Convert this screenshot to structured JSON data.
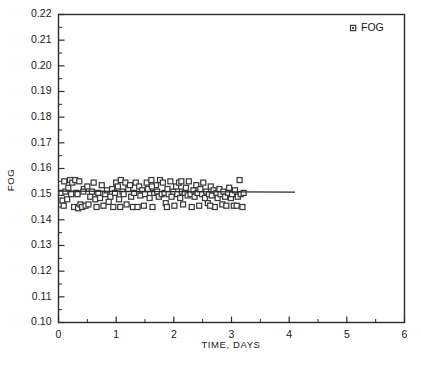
{
  "chart_data": {
    "type": "scatter",
    "title": "",
    "xlabel": "TIME, DAYS",
    "ylabel": "FOG",
    "xlim": [
      0,
      6
    ],
    "ylim": [
      0.1,
      0.22
    ],
    "xticks": [
      0,
      1,
      2,
      3,
      4,
      5,
      6
    ],
    "xtick_labels": [
      "0",
      "1",
      "2",
      "3",
      "4",
      "5",
      "6"
    ],
    "yticks": [
      0.1,
      0.11,
      0.12,
      0.13,
      0.14,
      0.15,
      0.16,
      0.17,
      0.18,
      0.19,
      0.2,
      0.21,
      0.22
    ],
    "ytick_labels": [
      "0.10",
      "0.11",
      "0.12",
      "0.13",
      "0.14",
      "0.15",
      "0.16",
      "0.17",
      "0.18",
      "0.19",
      "0.20",
      "0.21",
      "0.22"
    ],
    "x_minor_tick_step": 0.5,
    "y_minor_tick_step": 0.005,
    "grid": false,
    "legend_position": "top-right",
    "marker_style": "open-square",
    "series": [
      {
        "name": "FOG",
        "marker": "square",
        "points": [
          [
            0.05,
            0.1505
          ],
          [
            0.07,
            0.1475
          ],
          [
            0.1,
            0.155
          ],
          [
            0.12,
            0.151
          ],
          [
            0.15,
            0.148
          ],
          [
            0.17,
            0.1525
          ],
          [
            0.2,
            0.1555
          ],
          [
            0.22,
            0.15
          ],
          [
            0.24,
            0.1545
          ],
          [
            0.27,
            0.145
          ],
          [
            0.29,
            0.1555
          ],
          [
            0.31,
            0.1505
          ],
          [
            0.34,
            0.1445
          ],
          [
            0.36,
            0.155
          ],
          [
            0.38,
            0.146
          ],
          [
            0.41,
            0.145
          ],
          [
            0.44,
            0.152
          ],
          [
            0.47,
            0.1455
          ],
          [
            0.5,
            0.153
          ],
          [
            0.52,
            0.146
          ],
          [
            0.55,
            0.149
          ],
          [
            0.58,
            0.151
          ],
          [
            0.61,
            0.1545
          ],
          [
            0.64,
            0.148
          ],
          [
            0.66,
            0.145
          ],
          [
            0.69,
            0.1505
          ],
          [
            0.72,
            0.1485
          ],
          [
            0.75,
            0.1535
          ],
          [
            0.78,
            0.1455
          ],
          [
            0.81,
            0.15
          ],
          [
            0.84,
            0.1515
          ],
          [
            0.87,
            0.147
          ],
          [
            0.9,
            0.149
          ],
          [
            0.93,
            0.152
          ],
          [
            0.95,
            0.145
          ],
          [
            0.98,
            0.1505
          ],
          [
            1.0,
            0.1545
          ],
          [
            1.03,
            0.153
          ],
          [
            1.05,
            0.148
          ],
          [
            1.08,
            0.1555
          ],
          [
            1.11,
            0.151
          ],
          [
            1.13,
            0.15
          ],
          [
            1.16,
            0.1545
          ],
          [
            1.18,
            0.146
          ],
          [
            1.21,
            0.152
          ],
          [
            1.24,
            0.1535
          ],
          [
            1.26,
            0.149
          ],
          [
            1.29,
            0.145
          ],
          [
            1.31,
            0.1505
          ],
          [
            1.34,
            0.1545
          ],
          [
            1.37,
            0.145
          ],
          [
            1.4,
            0.153
          ],
          [
            1.42,
            0.1495
          ],
          [
            1.45,
            0.1515
          ],
          [
            1.48,
            0.1455
          ],
          [
            1.5,
            0.15
          ],
          [
            1.53,
            0.1545
          ],
          [
            1.55,
            0.152
          ],
          [
            1.58,
            0.1485
          ],
          [
            1.61,
            0.1555
          ],
          [
            1.63,
            0.145
          ],
          [
            1.66,
            0.1505
          ],
          [
            1.69,
            0.1535
          ],
          [
            1.71,
            0.151
          ],
          [
            1.74,
            0.149
          ],
          [
            1.76,
            0.1555
          ],
          [
            1.79,
            0.15
          ],
          [
            1.81,
            0.1545
          ],
          [
            1.84,
            0.1505
          ],
          [
            1.86,
            0.1465
          ],
          [
            1.89,
            0.152
          ],
          [
            1.91,
            0.15
          ],
          [
            1.94,
            0.155
          ],
          [
            1.96,
            0.149
          ],
          [
            1.99,
            0.151
          ],
          [
            2.01,
            0.1455
          ],
          [
            2.04,
            0.153
          ],
          [
            2.06,
            0.15
          ],
          [
            2.09,
            0.1545
          ],
          [
            2.11,
            0.1485
          ],
          [
            2.14,
            0.151
          ],
          [
            2.16,
            0.146
          ],
          [
            2.19,
            0.1505
          ],
          [
            2.21,
            0.1525
          ],
          [
            2.24,
            0.1495
          ],
          [
            2.26,
            0.155
          ],
          [
            2.29,
            0.15
          ],
          [
            2.31,
            0.145
          ],
          [
            2.34,
            0.1515
          ],
          [
            2.36,
            0.149
          ],
          [
            2.39,
            0.1535
          ],
          [
            2.41,
            0.1505
          ],
          [
            2.44,
            0.1455
          ],
          [
            2.46,
            0.152
          ],
          [
            2.49,
            0.15
          ],
          [
            2.51,
            0.1545
          ],
          [
            2.54,
            0.1485
          ],
          [
            2.56,
            0.151
          ],
          [
            2.59,
            0.1465
          ],
          [
            2.61,
            0.15
          ],
          [
            2.64,
            0.153
          ],
          [
            2.66,
            0.1495
          ],
          [
            2.69,
            0.1515
          ],
          [
            2.71,
            0.145
          ],
          [
            2.74,
            0.1505
          ],
          [
            2.76,
            0.1485
          ],
          [
            2.79,
            0.152
          ],
          [
            2.81,
            0.15
          ],
          [
            2.84,
            0.146
          ],
          [
            2.86,
            0.151
          ],
          [
            2.89,
            0.149
          ],
          [
            2.91,
            0.1455
          ],
          [
            2.94,
            0.1505
          ],
          [
            2.96,
            0.1525
          ],
          [
            2.99,
            0.1485
          ],
          [
            3.01,
            0.15
          ],
          [
            3.04,
            0.1455
          ],
          [
            3.06,
            0.1515
          ],
          [
            3.09,
            0.1455
          ],
          [
            3.11,
            0.149
          ],
          [
            3.14,
            0.1555
          ],
          [
            3.16,
            0.15
          ],
          [
            3.19,
            0.145
          ],
          [
            3.21,
            0.1505
          ],
          [
            0.09,
            0.1455
          ],
          [
            0.43,
            0.151
          ],
          [
            1.07,
            0.145
          ],
          [
            1.62,
            0.153
          ],
          [
            2.13,
            0.155
          ],
          [
            2.63,
            0.1455
          ],
          [
            0.33,
            0.15
          ],
          [
            1.88,
            0.145
          ]
        ]
      }
    ],
    "trend_line": {
      "name": "fit",
      "x_start": 0.0,
      "x_end": 4.1,
      "y_start": 0.1512,
      "y_end": 0.1508
    },
    "legend": [
      {
        "label": "FOG",
        "marker": "square"
      }
    ]
  },
  "colors": {
    "axis": "#2b2b2b",
    "marker_edge": "#3a3a3a",
    "marker_fill": "#ffffff",
    "trend_line": "#2b2b2b",
    "background": "#ffffff",
    "text": "#1a1a1a"
  }
}
